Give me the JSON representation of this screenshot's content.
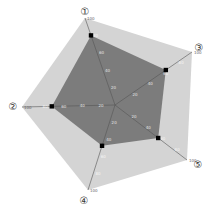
{
  "chart_data": {
    "type": "radar",
    "title": "",
    "axes": [
      "①",
      "②",
      "③",
      "④",
      "⑤"
    ],
    "range": [
      0,
      100
    ],
    "series": [
      {
        "name": "outer",
        "values": [
          100,
          100,
          100,
          100,
          100
        ],
        "color": "#d4d4d4"
      },
      {
        "name": "value",
        "values": [
          80,
          68,
          66,
          48,
          60
        ],
        "color": "#7c7c7c"
      }
    ],
    "ticks": [
      20,
      40,
      60,
      80
    ],
    "grid": false,
    "legend": "none"
  },
  "colors": {
    "outer_fill": "#d4d4d4",
    "inner_fill": "#7c7c7c",
    "axis_line": "#555555",
    "marker": "#000000"
  }
}
